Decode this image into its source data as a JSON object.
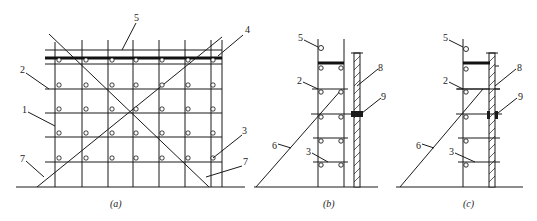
{
  "figure": {
    "panels": [
      {
        "id": "a",
        "caption": "(a)",
        "view": "front elevation",
        "labels": [
          {
            "text": "5",
            "x": 134,
            "y": 21
          },
          {
            "text": "4",
            "x": 245,
            "y": 33
          },
          {
            "text": "2",
            "x": 20,
            "y": 73
          },
          {
            "text": "1",
            "x": 22,
            "y": 113
          },
          {
            "text": "3",
            "x": 242,
            "y": 134
          },
          {
            "text": "7",
            "x": 20,
            "y": 162
          },
          {
            "text": "7",
            "x": 243,
            "y": 165
          }
        ]
      },
      {
        "id": "b",
        "caption": "(b)",
        "view": "side section, double-row",
        "labels": [
          {
            "text": "5",
            "x": 298,
            "y": 41
          },
          {
            "text": "2",
            "x": 297,
            "y": 84
          },
          {
            "text": "8",
            "x": 378,
            "y": 71
          },
          {
            "text": "9",
            "x": 381,
            "y": 100
          },
          {
            "text": "6",
            "x": 272,
            "y": 149
          },
          {
            "text": "3",
            "x": 306,
            "y": 155
          }
        ]
      },
      {
        "id": "c",
        "caption": "(c)",
        "view": "side section, single-row",
        "labels": [
          {
            "text": "5",
            "x": 443,
            "y": 41
          },
          {
            "text": "2",
            "x": 443,
            "y": 84
          },
          {
            "text": "8",
            "x": 517,
            "y": 71
          },
          {
            "text": "9",
            "x": 518,
            "y": 100
          },
          {
            "text": "6",
            "x": 416,
            "y": 149
          },
          {
            "text": "3",
            "x": 449,
            "y": 155
          }
        ]
      }
    ]
  }
}
